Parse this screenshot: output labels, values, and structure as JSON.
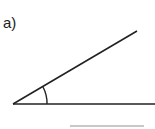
{
  "question": {
    "label": "a)",
    "figure": "angle",
    "stroke_color": "#222222",
    "answer_line_color": "#c8c8c8"
  }
}
